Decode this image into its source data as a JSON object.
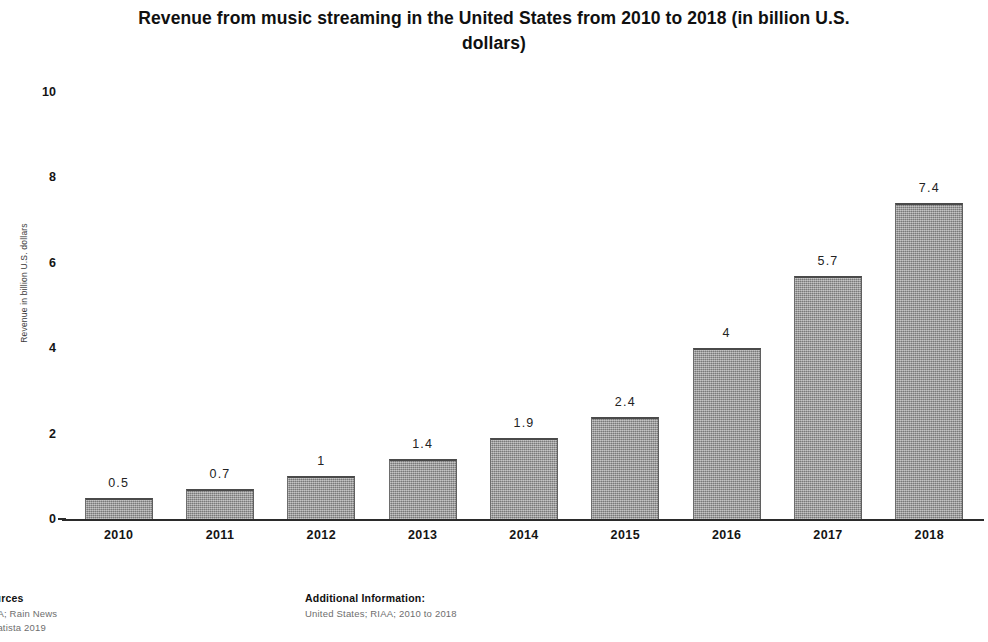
{
  "chart_data": {
    "type": "bar",
    "title": "Revenue from music streaming in the United States from 2010 to 2018 (in billion U.S. dollars)",
    "title_line1": "Revenue from music streaming in the United States from 2010 to 2018 (in billion U.S.",
    "title_line2": "dollars)",
    "xlabel": "",
    "ylabel": "Revenue in billion U.S. dollars",
    "categories": [
      "2010",
      "2011",
      "2012",
      "2013",
      "2014",
      "2015",
      "2016",
      "2017",
      "2018"
    ],
    "values": [
      0.5,
      0.7,
      1,
      1.4,
      1.9,
      2.4,
      4,
      5.7,
      7.4
    ],
    "value_labels": [
      "0.5",
      "0.7",
      "1",
      "1.4",
      "1.9",
      "2.4",
      "4",
      "5.7",
      "7.4"
    ],
    "ylim": [
      0,
      10
    ],
    "yticks": [
      0,
      2,
      4,
      6,
      8,
      10
    ],
    "ytick_labels": [
      "0",
      "2",
      "4",
      "6",
      "8",
      "10"
    ],
    "grid": false,
    "legend": null,
    "bar_color": "#9a9a9a",
    "bar_edge_color": "#4a4a4a"
  },
  "footer": {
    "sources_heading": "ources",
    "sources_lines": [
      "IAA; Rain News",
      "Statista 2019"
    ],
    "additional_heading": "Additional Information:",
    "additional_lines": [
      "United States; RIAA; 2010 to 2018"
    ]
  }
}
